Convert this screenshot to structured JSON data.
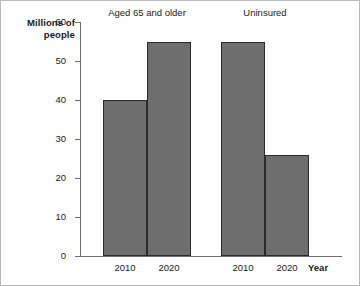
{
  "chart_data": {
    "type": "bar",
    "title": "",
    "xlabel": "Year",
    "ylabel": "Millions of people",
    "ylim": [
      0,
      60
    ],
    "yticks": [
      0,
      10,
      20,
      30,
      40,
      50,
      60
    ],
    "ytick_labels": [
      "0",
      "10",
      "20",
      "30",
      "40",
      "50",
      "60"
    ],
    "grid": false,
    "legend": "none",
    "categories": [
      "2010",
      "2020"
    ],
    "groups": [
      {
        "name": "Aged 65 and older",
        "bars": [
          {
            "category": "2010",
            "value": 40
          },
          {
            "category": "2020",
            "value": 55
          }
        ]
      },
      {
        "name": "Uninsured",
        "bars": [
          {
            "category": "2010",
            "value": 55
          },
          {
            "category": "2020",
            "value": 26
          }
        ]
      }
    ],
    "series": [
      {
        "name": "2010",
        "values": [
          40,
          55
        ]
      },
      {
        "name": "2020",
        "values": [
          55,
          26
        ]
      }
    ],
    "colors": {
      "bar_fill": "#6e6e6e",
      "bar_edge": "#2b2b2b",
      "axis": "#6f6f6f",
      "frame": "#b9b9b9",
      "text": "#1a1a1a"
    }
  }
}
